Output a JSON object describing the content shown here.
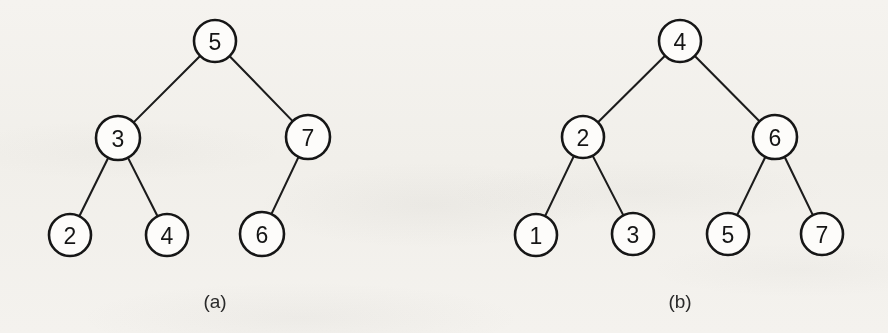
{
  "figure": {
    "background_color": "#f9f8f6",
    "ink_color": "#161616",
    "panels": [
      {
        "caption": "(a)",
        "caption_x": 215,
        "caption_y": 301,
        "nodes": [
          {
            "id": "a-5",
            "label": "5",
            "cx": 215,
            "cy": 41,
            "r": 21
          },
          {
            "id": "a-3",
            "label": "3",
            "cx": 118,
            "cy": 138,
            "r": 22
          },
          {
            "id": "a-7",
            "label": "7",
            "cx": 308,
            "cy": 137,
            "r": 22
          },
          {
            "id": "a-2",
            "label": "2",
            "cx": 70,
            "cy": 235,
            "r": 21
          },
          {
            "id": "a-4",
            "label": "4",
            "cx": 167,
            "cy": 235,
            "r": 21
          },
          {
            "id": "a-6",
            "label": "6",
            "cx": 262,
            "cy": 234,
            "r": 22
          }
        ],
        "edges": [
          {
            "from": "a-5",
            "to": "a-3"
          },
          {
            "from": "a-5",
            "to": "a-7"
          },
          {
            "from": "a-3",
            "to": "a-2"
          },
          {
            "from": "a-3",
            "to": "a-4"
          },
          {
            "from": "a-7",
            "to": "a-6"
          }
        ]
      },
      {
        "caption": "(b)",
        "caption_x": 680,
        "caption_y": 301,
        "nodes": [
          {
            "id": "b-4",
            "label": "4",
            "cx": 680,
            "cy": 41,
            "r": 21
          },
          {
            "id": "b-2",
            "label": "2",
            "cx": 583,
            "cy": 137,
            "r": 21
          },
          {
            "id": "b-6",
            "label": "6",
            "cx": 775,
            "cy": 137,
            "r": 22
          },
          {
            "id": "b-1",
            "label": "1",
            "cx": 536,
            "cy": 235,
            "r": 21
          },
          {
            "id": "b-3",
            "label": "3",
            "cx": 633,
            "cy": 234,
            "r": 21
          },
          {
            "id": "b-5",
            "label": "5",
            "cx": 728,
            "cy": 234,
            "r": 21
          },
          {
            "id": "b-7",
            "label": "7",
            "cx": 822,
            "cy": 234,
            "r": 21
          }
        ],
        "edges": [
          {
            "from": "b-4",
            "to": "b-2"
          },
          {
            "from": "b-4",
            "to": "b-6"
          },
          {
            "from": "b-2",
            "to": "b-1"
          },
          {
            "from": "b-2",
            "to": "b-3"
          },
          {
            "from": "b-6",
            "to": "b-5"
          },
          {
            "from": "b-6",
            "to": "b-7"
          }
        ]
      }
    ]
  },
  "chart_data": {
    "type": "diagram",
    "diagram_type": "binary-tree",
    "title": "",
    "panels": [
      {
        "caption": "(a)",
        "root": "5",
        "node_values": [
          "5",
          "3",
          "7",
          "2",
          "4",
          "6"
        ],
        "adjacency": [
          {
            "parent": "5",
            "left": "3",
            "right": "7"
          },
          {
            "parent": "3",
            "left": "2",
            "right": "4"
          },
          {
            "parent": "7",
            "left": "6",
            "right": null
          }
        ],
        "levels": [
          [
            "5"
          ],
          [
            "3",
            "7"
          ],
          [
            "2",
            "4",
            "6"
          ]
        ]
      },
      {
        "caption": "(b)",
        "root": "4",
        "node_values": [
          "4",
          "2",
          "6",
          "1",
          "3",
          "5",
          "7"
        ],
        "adjacency": [
          {
            "parent": "4",
            "left": "2",
            "right": "6"
          },
          {
            "parent": "2",
            "left": "1",
            "right": "3"
          },
          {
            "parent": "6",
            "left": "5",
            "right": "7"
          }
        ],
        "levels": [
          [
            "4"
          ],
          [
            "2",
            "6"
          ],
          [
            "1",
            "3",
            "5",
            "7"
          ]
        ]
      }
    ]
  }
}
